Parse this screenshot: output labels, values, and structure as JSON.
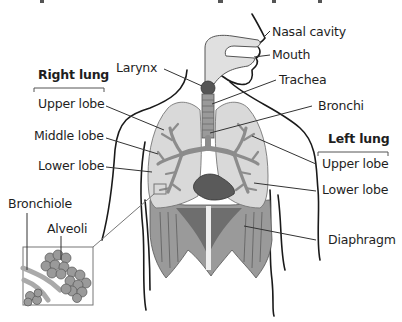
{
  "diagram": {
    "title_clipped": "",
    "sections": {
      "right_lung": {
        "header": "Right lung",
        "labels": [
          "Upper lobe",
          "Middle lobe",
          "Lower lobe"
        ]
      },
      "left_lung": {
        "header": "Left lung",
        "labels": [
          "Upper lobe",
          "Lower lobe"
        ]
      }
    },
    "labels": {
      "nasal_cavity": "Nasal cavity",
      "mouth": "Mouth",
      "larynx": "Larynx",
      "trachea": "Trachea",
      "bronchi": "Bronchi",
      "right_upper": "Upper lobe",
      "right_middle": "Middle lobe",
      "right_lower": "Lower lobe",
      "left_upper": "Upper lobe",
      "left_lower": "Lower lobe",
      "bronchiole": "Bronchiole",
      "alveoli": "Alveoli",
      "diaphragm": "Diaphragm"
    },
    "colors": {
      "outline": "#1a1a1a",
      "lung_fill": "#d9d9d9",
      "bronchi_fill": "#8c8c8c",
      "airway_fill": "#e0e0e0",
      "larynx_fill": "#555555",
      "heart_fill": "#5a5a5a",
      "diaphragm_dark": "#6e6e6e",
      "diaphragm_light": "#9a9a9a",
      "leader_line": "#333333"
    }
  }
}
